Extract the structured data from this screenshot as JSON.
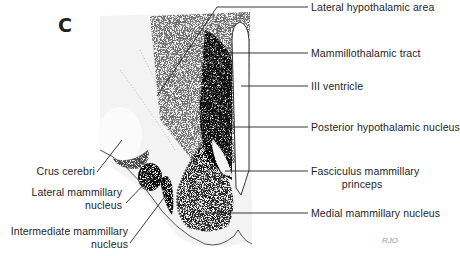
{
  "panel_label": "C",
  "signature": "RJO",
  "labels_right": [
    {
      "id": "lateral-hypothalamic-area",
      "text": "Lateral hypothalamic area"
    },
    {
      "id": "mammillothalamic-tract",
      "text": "Mammillothalamic tract"
    },
    {
      "id": "iii-ventricle",
      "text": "III ventricle"
    },
    {
      "id": "posterior-hypothalamic-nucleus",
      "text": "Posterior hypothalamic nucleus"
    },
    {
      "id": "fasciculus-mammillary-princeps-1",
      "text": "Fasciculus mammillary"
    },
    {
      "id": "fasciculus-mammillary-princeps-2",
      "text": "princeps"
    },
    {
      "id": "medial-mammillary-nucleus",
      "text": "Medial mammillary nucleus"
    }
  ],
  "labels_left": [
    {
      "id": "crus-cerebri",
      "text": "Crus cerebri"
    },
    {
      "id": "lateral-mammillary-nucleus-1",
      "text": "Lateral mammillary"
    },
    {
      "id": "lateral-mammillary-nucleus-2",
      "text": "nucleus"
    },
    {
      "id": "intermediate-mammillary-nucleus-1",
      "text": "Intermediate mammillary"
    },
    {
      "id": "intermediate-mammillary-nucleus-2",
      "text": "nucleus"
    }
  ]
}
